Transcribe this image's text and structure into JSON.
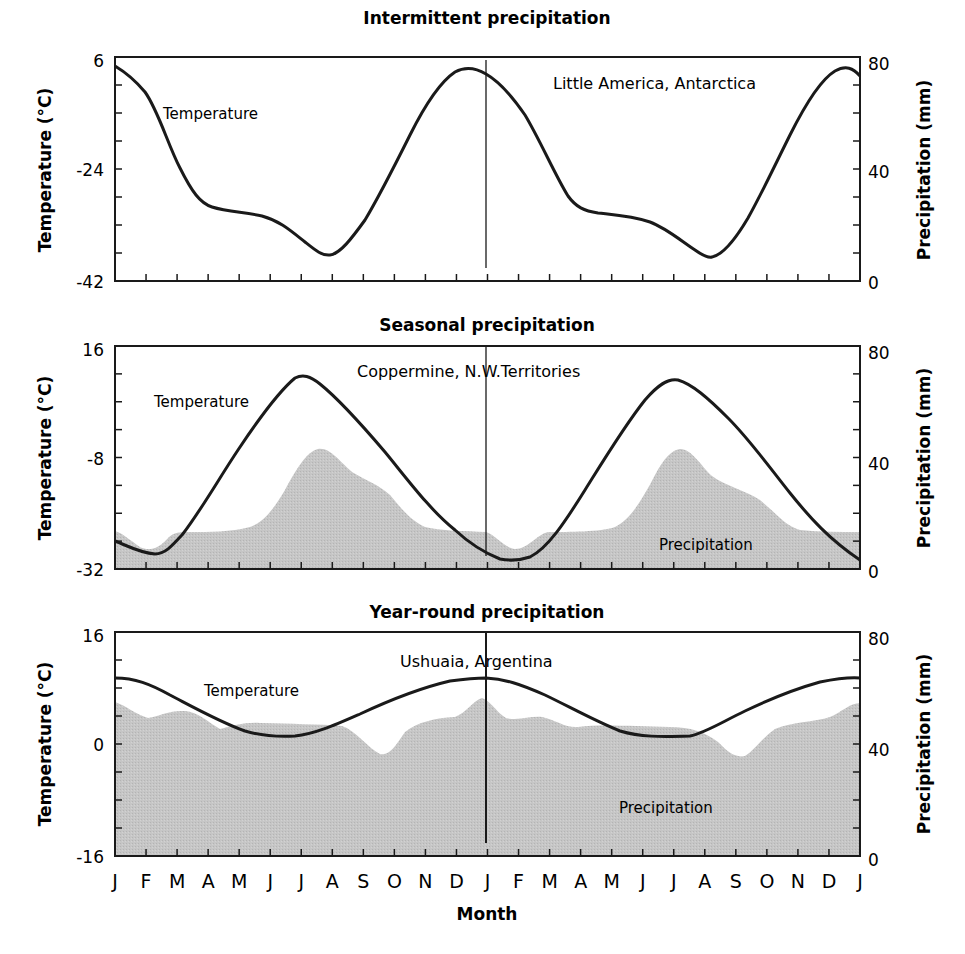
{
  "figure": {
    "xlabel": "Month",
    "months": [
      "J",
      "F",
      "M",
      "A",
      "M",
      "J",
      "J",
      "A",
      "S",
      "O",
      "N",
      "D",
      "J",
      "F",
      "M",
      "A",
      "M",
      "J",
      "J",
      "A",
      "S",
      "O",
      "N",
      "D",
      "J"
    ],
    "colors": {
      "line": "#1a1a1a",
      "precip_fill": "#c4c4c4",
      "background": "#ffffff"
    }
  },
  "panels": [
    {
      "title": "Intermittent precipitation",
      "station": "Little America, Antarctica",
      "temp_label": "Temperature",
      "precip_label": "",
      "left_axis": {
        "title": "Temperature (°C)",
        "ticks": [
          "6",
          "-24",
          "-42"
        ]
      },
      "right_axis": {
        "title": "Precipitation (mm)",
        "ticks": [
          "80",
          "40",
          "0"
        ]
      }
    },
    {
      "title": "Seasonal precipitation",
      "station": "Coppermine, N.W.Territories",
      "temp_label": "Temperature",
      "precip_label": "Precipitation",
      "left_axis": {
        "title": "Temperature (°C)",
        "ticks": [
          "16",
          "-8",
          "-32"
        ]
      },
      "right_axis": {
        "title": "Precipitation (mm)",
        "ticks": [
          "80",
          "40",
          "0"
        ]
      }
    },
    {
      "title": "Year-round precipitation",
      "station": "Ushuaia, Argentina",
      "temp_label": "Temperature",
      "precip_label": "Precipitation",
      "left_axis": {
        "title": "Temperature (°C)",
        "ticks": [
          "16",
          "0",
          "-16"
        ]
      },
      "right_axis": {
        "title": "Precipitation (mm)",
        "ticks": [
          "80",
          "40",
          "0"
        ]
      }
    }
  ],
  "chart_data": [
    {
      "type": "line",
      "title": "Intermittent precipitation",
      "annotation": "Little America, Antarctica",
      "xlabel": "Month",
      "ylabel": "Temperature (°C)",
      "ylabel_right": "Precipitation (mm)",
      "ylim": [
        -42,
        6
      ],
      "ylim_right": [
        0,
        80
      ],
      "yticks": [
        6,
        -24,
        -42
      ],
      "yticks_right": [
        80,
        40,
        0
      ],
      "categories": [
        "J",
        "F",
        "M",
        "A",
        "M",
        "J",
        "J",
        "A",
        "S",
        "O",
        "N",
        "D",
        "J",
        "F",
        "M",
        "A",
        "M",
        "J",
        "J",
        "A",
        "S",
        "O",
        "N",
        "D",
        "J"
      ],
      "series": [
        {
          "name": "Temperature",
          "values": [
            4.1,
            -7.6,
            -23.9,
            -27.4,
            -30.3,
            -36.6,
            -35.1,
            -21.4,
            -5.3,
            3.2,
            4.1,
            2.6,
            3.2,
            -0.3,
            -13.6,
            -27.1,
            -28.1,
            -32.0,
            -36.8,
            -25.7,
            -12.4,
            0.1,
            3.4,
            4.5,
            4.3
          ]
        }
      ],
      "grid": false,
      "note": "Two-year cycle; temperature curve only"
    },
    {
      "type": "line+area",
      "title": "Seasonal precipitation",
      "annotation": "Coppermine, N.W.Territories",
      "xlabel": "Month",
      "ylabel": "Temperature (°C)",
      "ylabel_right": "Precipitation (mm)",
      "ylim": [
        -32,
        16
      ],
      "ylim_right": [
        0,
        80
      ],
      "yticks": [
        16,
        -8,
        -32
      ],
      "yticks_right": [
        80,
        40,
        0
      ],
      "categories": [
        "J",
        "F",
        "M",
        "A",
        "M",
        "J",
        "J",
        "A",
        "S",
        "O",
        "N",
        "D",
        "J",
        "F",
        "M",
        "A",
        "M",
        "J",
        "J",
        "A",
        "S",
        "O",
        "N",
        "D",
        "J"
      ],
      "series": [
        {
          "name": "Temperature",
          "axis": "left",
          "values": [
            -26.0,
            -28.5,
            -27.0,
            -18.8,
            -8.1,
            2.2,
            8.9,
            5.7,
            -2.5,
            -12.8,
            -20.0,
            -25.6,
            -27.6,
            -30.0,
            -29.3,
            -21.3,
            -10.5,
            -0.9,
            6.9,
            5.8,
            -2.3,
            -11.0,
            -19.2,
            -25.4,
            -29.2
          ]
        },
        {
          "name": "Precipitation",
          "axis": "right",
          "values": [
            13,
            7,
            13,
            13,
            14,
            19,
            37,
            39,
            32,
            28,
            15,
            13,
            13,
            7,
            13,
            13,
            14,
            18,
            38,
            38,
            30,
            27,
            14,
            13,
            13
          ]
        }
      ],
      "grid": false
    },
    {
      "type": "line+area",
      "title": "Year-round precipitation",
      "annotation": "Ushuaia, Argentina",
      "xlabel": "Month",
      "ylabel": "Temperature (°C)",
      "ylabel_right": "Precipitation (mm)",
      "ylim": [
        -16,
        16
      ],
      "ylim_right": [
        0,
        80
      ],
      "yticks": [
        16,
        0,
        -16
      ],
      "yticks_right": [
        80,
        40,
        0
      ],
      "categories": [
        "J",
        "F",
        "M",
        "A",
        "M",
        "J",
        "J",
        "A",
        "S",
        "O",
        "N",
        "D",
        "J",
        "F",
        "M",
        "A",
        "M",
        "J",
        "J",
        "A",
        "S",
        "O",
        "N",
        "D",
        "J"
      ],
      "series": [
        {
          "name": "Temperature",
          "axis": "left",
          "values": [
            9.4,
            8.7,
            6.0,
            3.6,
            2.1,
            1.3,
            1.3,
            2.3,
            4.8,
            6.8,
            8.4,
            9.1,
            9.4,
            8.9,
            6.4,
            3.7,
            1.9,
            1.1,
            1.1,
            2.6,
            4.9,
            7.0,
            8.4,
            9.1,
            9.4
          ]
        },
        {
          "name": "Precipitation",
          "axis": "right",
          "values": [
            55,
            49,
            50,
            45,
            47,
            47,
            47,
            47,
            40,
            36,
            47,
            49,
            57,
            49,
            49,
            46,
            47,
            47,
            47,
            46,
            37,
            36,
            47,
            49,
            55
          ]
        }
      ],
      "grid": false
    }
  ]
}
